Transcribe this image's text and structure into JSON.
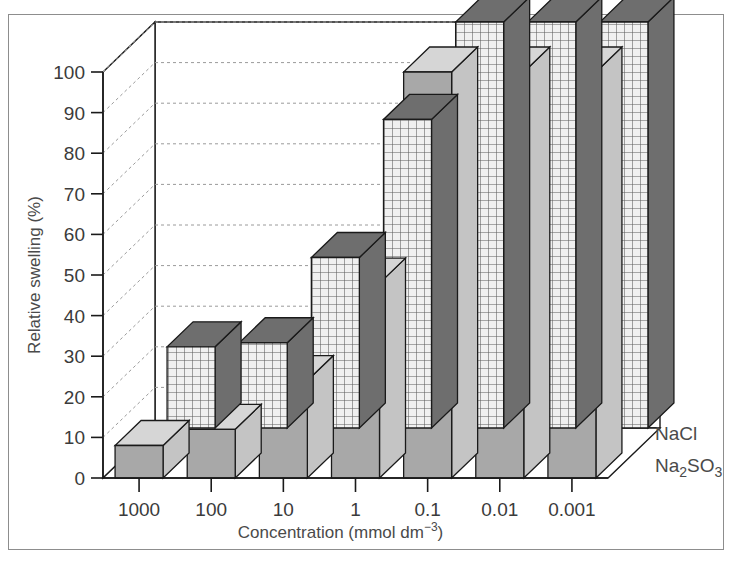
{
  "chart_data": {
    "type": "bar",
    "render": "3d-grouped-bar",
    "title": "",
    "xlabel": "Concentration (mmol dm−3)",
    "ylabel": "Relative swelling (%)",
    "categories": [
      "1000",
      "100",
      "10",
      "1",
      "0.1",
      "0.01",
      "0.001"
    ],
    "ylim": [
      0,
      100
    ],
    "yticks": [
      0,
      10,
      20,
      30,
      40,
      50,
      60,
      70,
      80,
      90,
      100
    ],
    "ytick_labels": [
      "0",
      "10",
      "20",
      "30",
      "40",
      "50",
      "60",
      "70",
      "80",
      "90",
      "100"
    ],
    "grid": true,
    "grid_style": "dashed-horizontal",
    "legend_position": "right",
    "series": [
      {
        "name": "NaCl",
        "style": "solid-gray",
        "values": [
          8,
          12,
          24,
          48,
          100,
          100,
          100
        ]
      },
      {
        "name": "Na₂SO₃",
        "style": "grid-hatched",
        "values": [
          20,
          21,
          42,
          76,
          100,
          100,
          100
        ]
      }
    ]
  },
  "axis": {
    "ylabel_text": "Relative swelling (%)",
    "xlabel_prefix": "Concentration (mmol dm",
    "xlabel_superscript": "−3",
    "xlabel_suffix": ")"
  },
  "legend": {
    "front_label": "NaCl",
    "back_label_prefix": "Na",
    "back_label_sub1": "2",
    "back_label_mid": "SO",
    "back_label_sub2": "3"
  },
  "colors": {
    "front_face": "#a8a8a8",
    "front_top": "#d6d6d6",
    "front_side": "#c4c4c4",
    "back_top": "#6e6e6e",
    "back_face_bg": "#f0f0f0",
    "back_grid_line": "#5a5a5a",
    "back_side": "#6e6e6e",
    "outline": "#1a1a1a",
    "wall": "#ffffff",
    "gridline": "#9a9a9a",
    "axis": "#1a1a1a",
    "frame": "#8d8d8d",
    "text": "#3b3b3b"
  }
}
